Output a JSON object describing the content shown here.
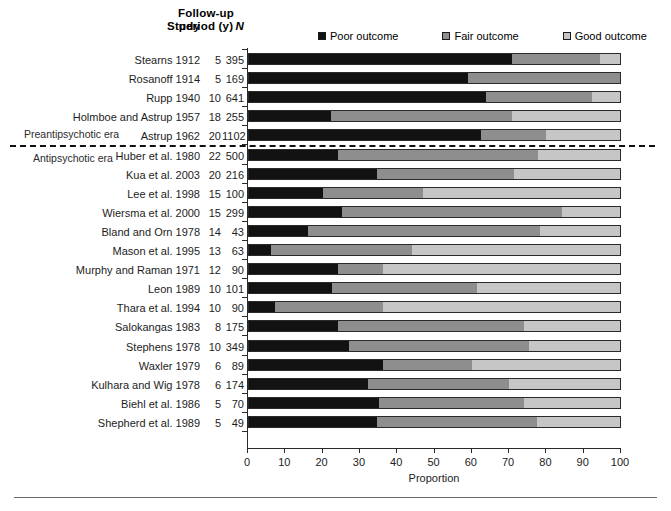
{
  "headers": {
    "study": "Study",
    "period_line1": "Follow-up",
    "period_line2": "period (y)",
    "n": "N"
  },
  "legend": [
    {
      "label": "Poor outcome",
      "color": "#121212",
      "icon": "square-filled-dark-icon"
    },
    {
      "label": "Fair outcome",
      "color": "#8e8e8e",
      "icon": "square-filled-mid-icon"
    },
    {
      "label": "Good outcome",
      "color": "#c6c6c6",
      "icon": "square-filled-light-icon"
    }
  ],
  "annotations": {
    "pre_era": "Preantipsychotic era",
    "post_era": "Antipsychotic era"
  },
  "chart_data": {
    "type": "bar",
    "orientation": "horizontal",
    "stacked": true,
    "title": "",
    "xlabel": "Proportion",
    "ylabel": "",
    "xlim": [
      0,
      100
    ],
    "xticks": [
      0,
      10,
      20,
      30,
      40,
      50,
      60,
      70,
      80,
      90,
      100
    ],
    "grid": false,
    "legend_position": "top-right",
    "series": [
      {
        "name": "Poor outcome",
        "color": "#121212",
        "values": [
          71,
          59,
          64,
          22,
          62.5,
          24,
          34.5,
          20,
          25,
          16,
          6,
          24,
          22.5,
          7,
          24,
          27,
          36,
          32,
          35,
          34.5
        ]
      },
      {
        "name": "Fair outcome",
        "color": "#8e8e8e",
        "values": [
          23.5,
          41,
          28.5,
          49,
          17.5,
          54,
          37,
          27,
          59.5,
          62.5,
          38,
          12,
          39,
          29,
          50,
          48.5,
          24,
          38,
          39,
          43
        ]
      },
      {
        "name": "Good outcome",
        "color": "#c6c6c6",
        "values": [
          5.5,
          0,
          7.5,
          29,
          20,
          22,
          28.5,
          53,
          15.5,
          21.5,
          56,
          64,
          38.5,
          64,
          26,
          24.5,
          40,
          30,
          26,
          22.5
        ]
      }
    ],
    "categories": [
      "Stearns 1912",
      "Rosanoff 1914",
      "Rupp 1940",
      "Holmboe and Astrup 1957",
      "Astrup 1962",
      "Huber et al. 1980",
      "Kua et al. 2003",
      "Lee et al. 1998",
      "Wiersma et al. 2000",
      "Bland and Orn 1978",
      "Mason et al. 1995",
      "Murphy and Raman 1971",
      "Leon 1989",
      "Thara et al. 1994",
      "Salokangas 1983",
      "Stephens 1978",
      "Waxler 1979",
      "Kulhara and Wig 1978",
      "Biehl et al. 1986",
      "Shepherd et al. 1989"
    ],
    "rows": [
      {
        "study": "Stearns 1912",
        "period": "5",
        "n": "395",
        "poor": 71,
        "fair": 23.5,
        "good": 5.5,
        "era": "pre"
      },
      {
        "study": "Rosanoff 1914",
        "period": "5",
        "n": "169",
        "poor": 59,
        "fair": 41,
        "good": 0,
        "era": "pre"
      },
      {
        "study": "Rupp 1940",
        "period": "10",
        "n": "641",
        "poor": 64,
        "fair": 28.5,
        "good": 7.5,
        "era": "pre"
      },
      {
        "study": "Holmboe and Astrup 1957",
        "period": "18",
        "n": "255",
        "poor": 22,
        "fair": 49,
        "good": 29,
        "era": "pre"
      },
      {
        "study": "Astrup 1962",
        "period": "20",
        "n": "1102",
        "poor": 62.5,
        "fair": 17.5,
        "good": 20,
        "era": "pre"
      },
      {
        "study": "Huber et al. 1980",
        "period": "22",
        "n": "500",
        "poor": 24,
        "fair": 54,
        "good": 22,
        "era": "post"
      },
      {
        "study": "Kua et al. 2003",
        "period": "20",
        "n": "216",
        "poor": 34.5,
        "fair": 37,
        "good": 28.5,
        "era": "post"
      },
      {
        "study": "Lee et al. 1998",
        "period": "15",
        "n": "100",
        "poor": 20,
        "fair": 27,
        "good": 53,
        "era": "post"
      },
      {
        "study": "Wiersma et al. 2000",
        "period": "15",
        "n": "299",
        "poor": 25,
        "fair": 59.5,
        "good": 15.5,
        "era": "post"
      },
      {
        "study": "Bland and Orn 1978",
        "period": "14",
        "n": "43",
        "poor": 16,
        "fair": 62.5,
        "good": 21.5,
        "era": "post"
      },
      {
        "study": "Mason et al. 1995",
        "period": "13",
        "n": "63",
        "poor": 6,
        "fair": 38,
        "good": 56,
        "era": "post"
      },
      {
        "study": "Murphy and Raman 1971",
        "period": "12",
        "n": "90",
        "poor": 24,
        "fair": 12,
        "good": 64,
        "era": "post"
      },
      {
        "study": "Leon 1989",
        "period": "10",
        "n": "101",
        "poor": 22.5,
        "fair": 39,
        "good": 38.5,
        "era": "post"
      },
      {
        "study": "Thara et al. 1994",
        "period": "10",
        "n": "90",
        "poor": 7,
        "fair": 29,
        "good": 64,
        "era": "post"
      },
      {
        "study": "Salokangas 1983",
        "period": "8",
        "n": "175",
        "poor": 24,
        "fair": 50,
        "good": 26,
        "era": "post"
      },
      {
        "study": "Stephens 1978",
        "period": "10",
        "n": "349",
        "poor": 27,
        "fair": 48.5,
        "good": 24.5,
        "era": "post"
      },
      {
        "study": "Waxler 1979",
        "period": "6",
        "n": "89",
        "poor": 36,
        "fair": 24,
        "good": 40,
        "era": "post"
      },
      {
        "study": "Kulhara and Wig 1978",
        "period": "6",
        "n": "174",
        "poor": 32,
        "fair": 38,
        "good": 30,
        "era": "post"
      },
      {
        "study": "Biehl et al. 1986",
        "period": "5",
        "n": "70",
        "poor": 35,
        "fair": 39,
        "good": 26,
        "era": "post"
      },
      {
        "study": "Shepherd et al. 1989",
        "period": "5",
        "n": "49",
        "poor": 34.5,
        "fair": 43,
        "good": 22.5,
        "era": "post"
      }
    ]
  }
}
